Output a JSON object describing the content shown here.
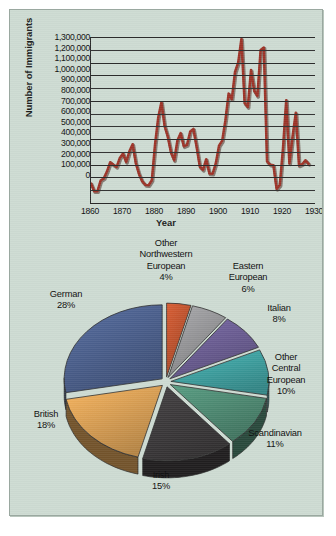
{
  "chart_data": [
    {
      "type": "line",
      "title": "",
      "xlabel": "Year",
      "ylabel": "Number of Immigrants",
      "xlim": [
        1860,
        1930
      ],
      "ylim": [
        0,
        1300000
      ],
      "grid": true,
      "legend": "none",
      "line_color": "#9c3327",
      "xticks": [
        "1860",
        "1870",
        "1880",
        "1890",
        "1900",
        "1910",
        "1920",
        "1930"
      ],
      "yticks": [
        "1,300,000",
        "1,200,000",
        "1,100,000",
        "1,000,000",
        "900,000",
        "800,000",
        "700,000",
        "600,000",
        "500,000",
        "400,000",
        "300,000",
        "200,000",
        "100,000",
        "0"
      ],
      "x": [
        1860,
        1861,
        1862,
        1863,
        1864,
        1865,
        1866,
        1867,
        1868,
        1869,
        1870,
        1871,
        1872,
        1873,
        1874,
        1875,
        1876,
        1877,
        1878,
        1879,
        1880,
        1881,
        1882,
        1883,
        1884,
        1885,
        1886,
        1887,
        1888,
        1889,
        1890,
        1891,
        1892,
        1893,
        1894,
        1895,
        1896,
        1897,
        1898,
        1899,
        1900,
        1901,
        1902,
        1903,
        1904,
        1905,
        1906,
        1907,
        1908,
        1909,
        1910,
        1911,
        1912,
        1913,
        1914,
        1915,
        1916,
        1917,
        1918,
        1919,
        1920,
        1921,
        1922,
        1923,
        1924,
        1925,
        1926,
        1927,
        1928
      ],
      "values": [
        153000,
        92000,
        92000,
        176000,
        193000,
        248000,
        319000,
        299000,
        283000,
        353000,
        387000,
        321000,
        405000,
        460000,
        313000,
        228000,
        170000,
        142000,
        139000,
        178000,
        457000,
        669000,
        789000,
        603000,
        519000,
        395000,
        334000,
        490000,
        547000,
        444000,
        455000,
        560000,
        580000,
        440000,
        285000,
        259000,
        343000,
        231000,
        229000,
        312000,
        449000,
        488000,
        649000,
        857000,
        813000,
        1026000,
        1101000,
        1285000,
        783000,
        752000,
        1041000,
        879000,
        838000,
        1198000,
        1218000,
        327000,
        299000,
        295000,
        111000,
        141000,
        430000,
        805000,
        310000,
        523000,
        707000,
        294000,
        304000,
        335000,
        307000
      ]
    },
    {
      "type": "pie",
      "title": "",
      "legend": "labels-outside",
      "labels": [
        "German",
        "Other Northwestern European",
        "Eastern European",
        "Italian",
        "Other Central European",
        "Scandinavian",
        "Irish",
        "British"
      ],
      "values": [
        28,
        4,
        6,
        8,
        10,
        11,
        15,
        18
      ],
      "value_labels": [
        "28%",
        "4%",
        "6%",
        "8%",
        "10%",
        "11%",
        "15%",
        "18%"
      ],
      "colors": [
        "#4d6190",
        "#c2542e",
        "#9a9a9c",
        "#6d5f96",
        "#3fa4a4",
        "#4f8c74",
        "#3d3a3c",
        "#dda255"
      ]
    }
  ],
  "line_chart": {
    "ylabel": "Number of Immigrants",
    "xlabel": "Year",
    "yticks": [
      "1,300,000",
      "1,200,000",
      "1,100,000",
      "1,000,000",
      "900,000",
      "800,000",
      "700,000",
      "600,000",
      "500,000",
      "400,000",
      "300,000",
      "200,000",
      "100,000",
      "0"
    ],
    "xticks": [
      "1860",
      "1870",
      "1880",
      "1890",
      "1900",
      "1910",
      "1920",
      "1930"
    ]
  },
  "pie_chart": {
    "slices": [
      {
        "label": "German",
        "pct": "28%"
      },
      {
        "label_lines": [
          "Other",
          "Northwestern",
          "European"
        ],
        "pct": "4%"
      },
      {
        "label_lines": [
          "Eastern",
          "European"
        ],
        "pct": "6%"
      },
      {
        "label": "Italian",
        "pct": "8%"
      },
      {
        "label_lines": [
          "Other",
          "Central",
          "European"
        ],
        "pct": "10%"
      },
      {
        "label": "Scandinavian",
        "pct": "11%"
      },
      {
        "label": "Irish",
        "pct": "15%"
      },
      {
        "label": "British",
        "pct": "18%"
      }
    ],
    "labels": {
      "german": "German",
      "german_pct": "28%",
      "other_nw_1": "Other",
      "other_nw_2": "Northwestern",
      "other_nw_3": "European",
      "other_nw_pct": "4%",
      "eastern_1": "Eastern",
      "eastern_2": "European",
      "eastern_pct": "6%",
      "italian": "Italian",
      "italian_pct": "8%",
      "other_central_1": "Other",
      "other_central_2": "Central",
      "other_central_3": "European",
      "other_central_pct": "10%",
      "scandinavian": "Scandinavian",
      "scandinavian_pct": "11%",
      "irish": "Irish",
      "irish_pct": "15%",
      "british": "British",
      "british_pct": "18%"
    }
  }
}
